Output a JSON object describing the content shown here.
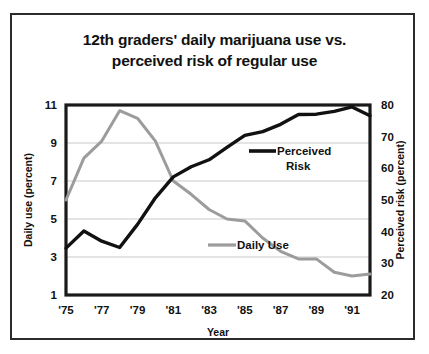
{
  "chart_data": {
    "type": "line",
    "title": "12th graders' daily marijuana use vs. perceived risk of regular use",
    "title_line1": "12th graders' daily marijuana use vs.",
    "title_line2": "perceived risk of regular use",
    "xlabel": "Year",
    "ylabel": "Daily use (percent)",
    "y2label": "Perceived risk (percent)",
    "grid": true,
    "legend_position": "inside-right",
    "xlim": [
      1975,
      1992
    ],
    "ylim": [
      1,
      11
    ],
    "y2lim": [
      20,
      80
    ],
    "xticks": [
      "'75",
      "'77",
      "'79",
      "'81",
      "'83",
      "'85",
      "'87",
      "'89",
      "'91"
    ],
    "xtick_values": [
      1975,
      1977,
      1979,
      1981,
      1983,
      1985,
      1987,
      1989,
      1991
    ],
    "yticks": [
      1,
      3,
      5,
      7,
      9,
      11
    ],
    "y2ticks": [
      20,
      30,
      40,
      50,
      60,
      70,
      80
    ],
    "x": [
      1975,
      1976,
      1977,
      1978,
      1979,
      1980,
      1981,
      1982,
      1983,
      1984,
      1985,
      1986,
      1987,
      1988,
      1989,
      1990,
      1991,
      1992
    ],
    "series": [
      {
        "name": "Daily Use",
        "legend_label": "Daily  Use",
        "axis": "left",
        "color": "#9c9c9c",
        "width": 3,
        "values": [
          6.0,
          8.2,
          9.1,
          10.7,
          10.3,
          9.1,
          7.0,
          6.3,
          5.5,
          5.0,
          4.9,
          4.0,
          3.3,
          2.9,
          2.9,
          2.2,
          2.0,
          2.1
        ]
      },
      {
        "name": "Perceived Risk",
        "legend_label_line1": "Perceived",
        "legend_label_line2": "Risk",
        "axis": "right",
        "color": "#111111",
        "width": 3.4,
        "values": [
          34.8,
          40.2,
          37.0,
          35.0,
          42.3,
          50.7,
          57.3,
          60.5,
          62.7,
          66.6,
          70.4,
          71.6,
          73.9,
          77.0,
          77.1,
          78.0,
          79.4,
          76.6
        ]
      }
    ]
  }
}
